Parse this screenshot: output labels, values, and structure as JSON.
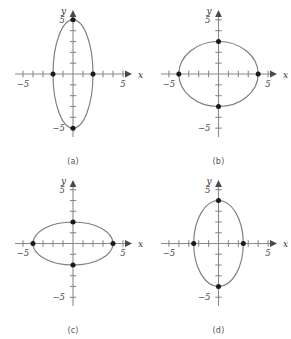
{
  "figure": {
    "background_color": "#ffffff",
    "curve_color": "#7e7e7e",
    "axis_color": "#8a8a8a",
    "point_color": "#1a1a1a",
    "label_color": "#4d4d4d"
  },
  "axes_common": {
    "x_label": "x",
    "y_label": "y",
    "x_tick_label_negative": "−5",
    "x_tick_label_positive": "5",
    "y_tick_label_negative": "−5",
    "y_tick_label_positive": "5",
    "x_range": [
      -6,
      6
    ],
    "y_range": [
      -6,
      6
    ],
    "tick_interval": 1,
    "labeled_ticks": [
      -5,
      5
    ],
    "grid": false
  },
  "chart_data": [
    {
      "type": "scatter",
      "panel_id": "a",
      "caption": "(a)",
      "title": "",
      "xlabel": "x",
      "ylabel": "y",
      "xlim": [
        -6,
        6
      ],
      "ylim": [
        -6,
        6
      ],
      "xticks": [
        -5,
        -4,
        -3,
        -2,
        -1,
        1,
        2,
        3,
        4,
        5
      ],
      "yticks": [
        -5,
        -4,
        -3,
        -2,
        -1,
        1,
        2,
        3,
        4,
        5
      ],
      "xtick_labels": {
        "-5": "−5",
        "5": "5"
      },
      "ytick_labels": {
        "-5": "−5",
        "5": "5"
      },
      "shape": "ellipse",
      "center": [
        0,
        0
      ],
      "semi_axis_x": 2,
      "semi_axis_y": 5,
      "orientation": "vertical",
      "marked_points": [
        [
          -2,
          0
        ],
        [
          2,
          0
        ],
        [
          0,
          5
        ],
        [
          0,
          -5
        ]
      ],
      "grid": false,
      "legend": "none"
    },
    {
      "type": "scatter",
      "panel_id": "b",
      "caption": "(b)",
      "title": "",
      "xlabel": "x",
      "ylabel": "y",
      "xlim": [
        -6,
        6
      ],
      "ylim": [
        -6,
        6
      ],
      "xticks": [
        -5,
        -4,
        -3,
        -2,
        -1,
        1,
        2,
        3,
        4,
        5
      ],
      "yticks": [
        -5,
        -4,
        -3,
        -2,
        -1,
        1,
        2,
        3,
        4,
        5
      ],
      "xtick_labels": {
        "-5": "−5",
        "5": "5"
      },
      "ytick_labels": {
        "-5": "−5",
        "5": "5"
      },
      "shape": "ellipse",
      "center": [
        0,
        0
      ],
      "semi_axis_x": 4,
      "semi_axis_y": 3,
      "orientation": "horizontal",
      "marked_points": [
        [
          -4,
          0
        ],
        [
          4,
          0
        ],
        [
          0,
          3
        ],
        [
          0,
          -3
        ]
      ],
      "grid": false,
      "legend": "none"
    },
    {
      "type": "scatter",
      "panel_id": "c",
      "caption": "(c)",
      "title": "",
      "xlabel": "x",
      "ylabel": "y",
      "xlim": [
        -6,
        6
      ],
      "ylim": [
        -6,
        6
      ],
      "xticks": [
        -5,
        -4,
        -3,
        -2,
        -1,
        1,
        2,
        3,
        4,
        5
      ],
      "yticks": [
        -5,
        -4,
        -3,
        -2,
        -1,
        1,
        2,
        3,
        4,
        5
      ],
      "xtick_labels": {
        "-5": "−5",
        "5": "5"
      },
      "ytick_labels": {
        "-5": "−5",
        "5": "5"
      },
      "shape": "ellipse",
      "center": [
        0,
        0
      ],
      "semi_axis_x": 4,
      "semi_axis_y": 2,
      "orientation": "horizontal",
      "marked_points": [
        [
          -4,
          0
        ],
        [
          4,
          0
        ],
        [
          0,
          2
        ],
        [
          0,
          -2
        ]
      ],
      "grid": false,
      "legend": "none"
    },
    {
      "type": "scatter",
      "panel_id": "d",
      "caption": "(d)",
      "title": "",
      "xlabel": "x",
      "ylabel": "y",
      "xlim": [
        -6,
        6
      ],
      "ylim": [
        -6,
        6
      ],
      "xticks": [
        -5,
        -4,
        -3,
        -2,
        -1,
        1,
        2,
        3,
        4,
        5
      ],
      "yticks": [
        -5,
        -4,
        -3,
        -2,
        -1,
        1,
        2,
        3,
        4,
        5
      ],
      "xtick_labels": {
        "-5": "−5",
        "5": "5"
      },
      "ytick_labels": {
        "-5": "−5",
        "5": "5"
      },
      "shape": "ellipse",
      "center": [
        0,
        0
      ],
      "semi_axis_x": 2.5,
      "semi_axis_y": 4,
      "orientation": "vertical",
      "marked_points": [
        [
          -2.5,
          0
        ],
        [
          2.5,
          0
        ],
        [
          0,
          4
        ],
        [
          0,
          -4
        ]
      ],
      "grid": false,
      "legend": "none"
    }
  ]
}
